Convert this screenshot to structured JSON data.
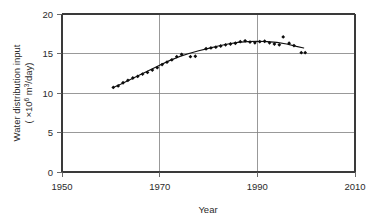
{
  "chart_data": {
    "type": "scatter",
    "title": "",
    "xlabel": "Year",
    "ylabel_line1": "Water distribution input",
    "ylabel_line2_pre": "( ×10",
    "ylabel_line2_sup1": "6",
    "ylabel_line2_mid": " m",
    "ylabel_line2_sup2": "3",
    "ylabel_line2_post": "/day)",
    "ylabel": "Water distribution input ( ×10⁶ m³/day)",
    "xlim": [
      1950,
      2010
    ],
    "ylim": [
      0,
      20
    ],
    "xticks": [
      1950,
      1970,
      1990,
      2010
    ],
    "yticks": [
      0,
      5,
      10,
      15,
      20
    ],
    "xtick_labels": [
      "1950",
      "1970",
      "1990",
      "2010"
    ],
    "ytick_labels": [
      "0",
      "5",
      "10",
      "15",
      "20"
    ],
    "grid": true,
    "grid_axis": "both-major",
    "legend": "none",
    "marker": "filled-diamond",
    "series": [
      {
        "name": "Water distribution input",
        "type": "scatter",
        "x": [
          1960.5,
          1961.5,
          1962.5,
          1963.5,
          1964.5,
          1965.5,
          1966.5,
          1967.5,
          1968.5,
          1969.5,
          1970.5,
          1971.5,
          1972.5,
          1973.5,
          1974.5,
          1976.3,
          1977.3,
          1979.5,
          1980.5,
          1981.5,
          1982.5,
          1983.5,
          1984.5,
          1985.5,
          1986.5,
          1987.5,
          1988.5,
          1989.5,
          1990.5,
          1991.5,
          1992.5,
          1993.5,
          1994.5,
          1995.3,
          1996.5,
          1997.5,
          1999.0,
          1999.8
        ],
        "y": [
          10.7,
          10.9,
          11.3,
          11.6,
          11.9,
          12.1,
          12.4,
          12.6,
          12.9,
          13.2,
          13.6,
          13.9,
          14.2,
          14.6,
          14.9,
          14.6,
          14.65,
          15.6,
          15.7,
          15.8,
          15.95,
          16.1,
          16.2,
          16.3,
          16.5,
          16.6,
          16.45,
          16.35,
          16.5,
          16.55,
          16.35,
          16.2,
          16.1,
          17.1,
          16.3,
          16.0,
          15.1,
          15.1
        ]
      }
    ],
    "trend": {
      "name": "fitted trend curve",
      "x": [
        1960.5,
        1962,
        1964,
        1966,
        1968,
        1970,
        1972,
        1974,
        1976,
        1978,
        1980,
        1982,
        1984,
        1986,
        1988,
        1990,
        1992,
        1994,
        1996,
        1998,
        1999.5
      ],
      "y": [
        10.7,
        11.1,
        11.7,
        12.3,
        12.9,
        13.5,
        14.1,
        14.6,
        15.0,
        15.35,
        15.65,
        15.95,
        16.2,
        16.4,
        16.5,
        16.55,
        16.5,
        16.4,
        16.2,
        15.9,
        15.7
      ]
    }
  },
  "colors": {
    "marker": "#0d0d0d",
    "trend": "#111111",
    "grid": "#808080",
    "axis": "#3a3a3a",
    "text": "#2b2b2b",
    "background": "#ffffff"
  }
}
